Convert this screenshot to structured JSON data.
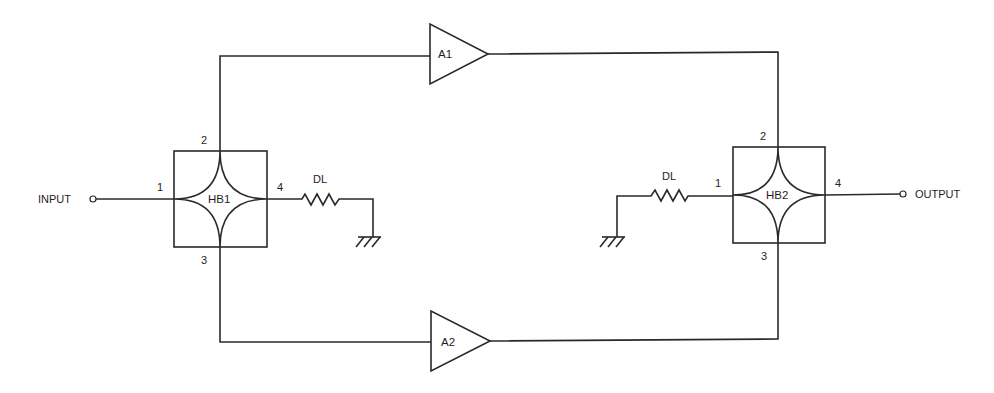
{
  "diagram": {
    "type": "balanced amplifier schematic",
    "colors": {
      "line": "#2a2a2a",
      "text": "#1e1e1e",
      "background": "#ffffff"
    },
    "terminals": {
      "input": {
        "label": "INPUT"
      },
      "output": {
        "label": "OUTPUT"
      }
    },
    "hybrids": [
      {
        "id": "HB1",
        "label": "HB1",
        "ports": {
          "p1": "1",
          "p2": "2",
          "p3": "3",
          "p4": "4"
        }
      },
      {
        "id": "HB2",
        "label": "HB2",
        "ports": {
          "p1": "1",
          "p2": "2",
          "p3": "3",
          "p4": "4"
        }
      }
    ],
    "amplifiers": [
      {
        "id": "A1",
        "label": "A1"
      },
      {
        "id": "A2",
        "label": "A2"
      }
    ],
    "loads": [
      {
        "id": "DL-left",
        "label": "DL"
      },
      {
        "id": "DL-right",
        "label": "DL"
      }
    ],
    "connections": [
      "INPUT → HB1.1",
      "HB1.2 → A1 → HB2.2",
      "HB1.3 → A2 → HB2.3",
      "HB1.4 → DL → ground",
      "HB2.1 → DL → ground",
      "HB2.4 → OUTPUT"
    ]
  }
}
